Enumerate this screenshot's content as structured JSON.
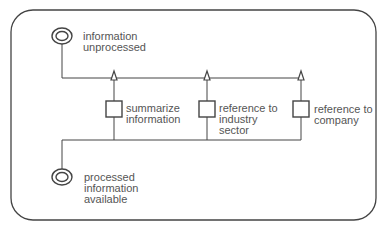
{
  "diagram": {
    "type": "process-flow",
    "nodes": {
      "start_state": {
        "label_line1": "information",
        "label_line2": "unprocessed",
        "kind": "state"
      },
      "task_1": {
        "label_line1": "summarize",
        "label_line2": "information",
        "kind": "activity"
      },
      "task_2": {
        "label_line1": "reference to",
        "label_line2": "industry",
        "label_line3": "sector",
        "kind": "activity"
      },
      "task_3": {
        "label_line1": "reference to",
        "label_line2": "company",
        "kind": "activity"
      },
      "end_state": {
        "label_line1": "processed",
        "label_line2": "information",
        "label_line3": "available",
        "kind": "state"
      }
    },
    "edges": [
      {
        "from": "start_state",
        "to": "task_1"
      },
      {
        "from": "start_state",
        "to": "task_2"
      },
      {
        "from": "start_state",
        "to": "task_3"
      },
      {
        "from": "task_1",
        "to": "end_state"
      },
      {
        "from": "task_2",
        "to": "end_state"
      },
      {
        "from": "task_3",
        "to": "end_state"
      }
    ],
    "colors": {
      "stroke": "#444444",
      "text": "#555555",
      "background": "#ffffff"
    }
  }
}
